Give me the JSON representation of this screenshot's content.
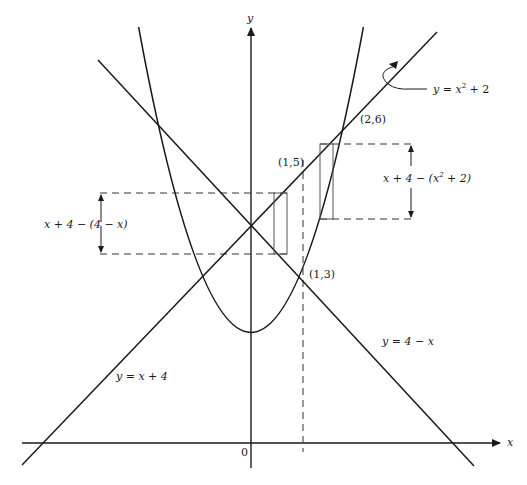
{
  "figure": {
    "axes": {
      "x_label": "x",
      "y_label": "y",
      "origin_label": "0"
    },
    "curves": [
      {
        "name": "parabola",
        "label": "y = x² + 2",
        "label_parts": {
          "pre": "y = x",
          "sup": "2",
          "post": " + 2"
        }
      },
      {
        "name": "line-rising",
        "label": "y = x + 4"
      },
      {
        "name": "line-falling",
        "label": "y = 4 − x"
      }
    ],
    "points": [
      {
        "label": "(2,6)"
      },
      {
        "label": "(1,5)"
      },
      {
        "label": "(1,3)"
      }
    ],
    "annotations": {
      "left_height": {
        "pre": "x + 4 − (4 − x)"
      },
      "right_height": {
        "pre": "x + 4 − (x",
        "sup": "2",
        "post": " + 2)"
      }
    }
  },
  "colors": {
    "stroke": "#1a1a1a",
    "background": "#ffffff"
  }
}
